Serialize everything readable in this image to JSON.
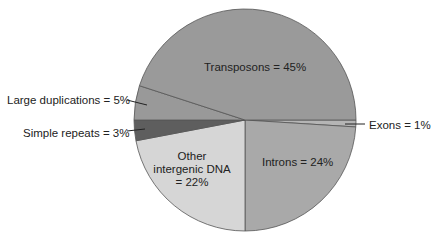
{
  "chart_data": {
    "type": "pie",
    "title": "",
    "slices": [
      {
        "label": "Transposons",
        "value": 45,
        "color": "#9a9a9a",
        "text": "Transposons = 45%"
      },
      {
        "label": "Exons",
        "value": 1,
        "color": "#b5b5b5",
        "text": "Exons = 1%"
      },
      {
        "label": "Introns",
        "value": 24,
        "color": "#a9a9a9",
        "text": "Introns = 24%"
      },
      {
        "label": "Other intergenic DNA",
        "value": 22,
        "color": "#d6d6d6",
        "text_lines": [
          "Other",
          "intergenic DNA",
          "= 22%"
        ]
      },
      {
        "label": "Simple repeats",
        "value": 3,
        "color": "#5e5e5e",
        "text": "Simple repeats = 3%"
      },
      {
        "label": "Large duplications",
        "value": 5,
        "color": "#999999",
        "text": "Large duplications = 5%"
      }
    ],
    "center": [
      245,
      120
    ],
    "radius": 111
  },
  "labels": {
    "transposons": "Transposons = 45%",
    "exons": "Exons = 1%",
    "introns": "Introns = 24%",
    "other_1": "Other",
    "other_2": "intergenic DNA",
    "other_3": "= 22%",
    "simple": "Simple repeats = 3%",
    "large": "Large duplications = 5%"
  }
}
